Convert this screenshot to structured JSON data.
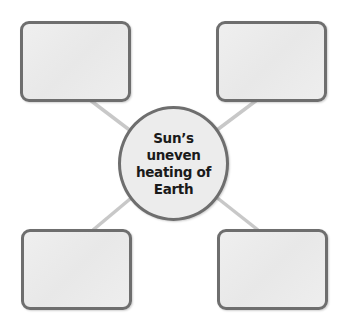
{
  "diagram": {
    "type": "concept-web",
    "center": {
      "label_lines": [
        "Sun’s uneven",
        "heating of",
        "Earth"
      ]
    },
    "outer_boxes": [
      {
        "position": "top-left",
        "text": ""
      },
      {
        "position": "top-right",
        "text": ""
      },
      {
        "position": "bottom-left",
        "text": ""
      },
      {
        "position": "bottom-right",
        "text": ""
      }
    ],
    "colors": {
      "border": "#6e6e6e",
      "fill": "#ececec",
      "connector": "#c8c8c8",
      "text": "#1a1a1a"
    }
  }
}
